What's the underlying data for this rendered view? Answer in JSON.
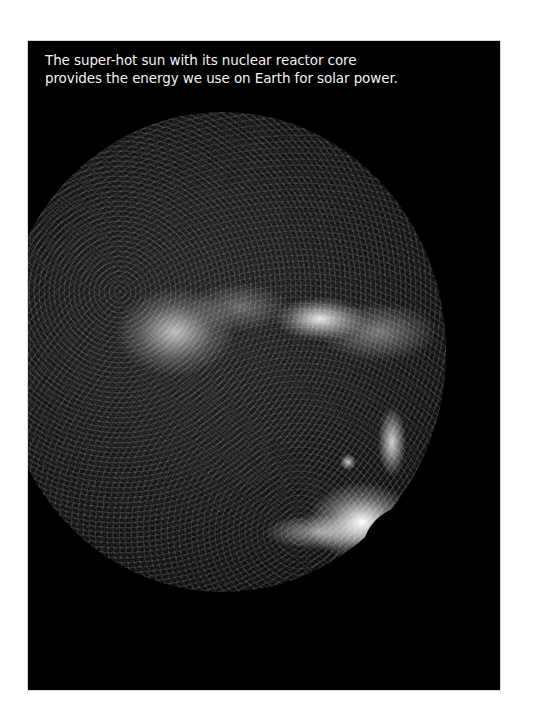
{
  "figure": {
    "caption_lines": [
      "The super-hot sun with its nuclear reactor core",
      "provides the energy we use on Earth for solar power."
    ],
    "image_subject": "sun-photograph",
    "colors": {
      "page_background": "#ffffff",
      "panel_background": "#000000",
      "caption_text": "#f2f2f2"
    }
  }
}
